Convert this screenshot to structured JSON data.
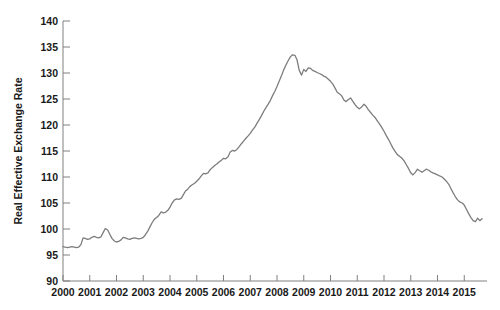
{
  "chart_data": {
    "type": "line",
    "title": "",
    "subtitle": "",
    "xlabel": "",
    "ylabel": "Real Effective Exchange Rate",
    "xlim": [
      2000.0,
      2015.85
    ],
    "ylim": [
      90,
      140
    ],
    "yticks": [
      90,
      95,
      100,
      105,
      110,
      115,
      120,
      125,
      130,
      135,
      140
    ],
    "ytick_labels": [
      "90",
      "95",
      "100",
      "105",
      "110",
      "115",
      "120",
      "125",
      "130",
      "135",
      "140"
    ],
    "xticks": [
      2000,
      2001,
      2002,
      2003,
      2004,
      2005,
      2006,
      2007,
      2008,
      2009,
      2010,
      2011,
      2012,
      2013,
      2014,
      2015
    ],
    "xtick_labels": [
      "2000",
      "2001",
      "2002",
      "2003",
      "2004",
      "2005",
      "2006",
      "2007",
      "2008",
      "2009",
      "2010",
      "2011",
      "2012",
      "2013",
      "2014",
      "2015"
    ],
    "grid": false,
    "legend": false,
    "legend_position": "none",
    "series": [
      {
        "name": "Real Effective Exchange Rate",
        "color": "#7d7d7d",
        "x": [
          2000.0,
          2000.08,
          2000.17,
          2000.25,
          2000.33,
          2000.42,
          2000.5,
          2000.58,
          2000.67,
          2000.75,
          2000.83,
          2000.92,
          2001.0,
          2001.08,
          2001.17,
          2001.25,
          2001.33,
          2001.42,
          2001.5,
          2001.58,
          2001.67,
          2001.75,
          2001.83,
          2001.92,
          2002.0,
          2002.08,
          2002.17,
          2002.25,
          2002.33,
          2002.42,
          2002.5,
          2002.58,
          2002.67,
          2002.75,
          2002.83,
          2002.92,
          2003.0,
          2003.08,
          2003.17,
          2003.25,
          2003.33,
          2003.42,
          2003.5,
          2003.58,
          2003.67,
          2003.75,
          2003.83,
          2003.92,
          2004.0,
          2004.08,
          2004.17,
          2004.25,
          2004.33,
          2004.42,
          2004.5,
          2004.58,
          2004.67,
          2004.75,
          2004.83,
          2004.92,
          2005.0,
          2005.08,
          2005.17,
          2005.25,
          2005.33,
          2005.42,
          2005.5,
          2005.58,
          2005.67,
          2005.75,
          2005.83,
          2005.92,
          2006.0,
          2006.08,
          2006.17,
          2006.25,
          2006.33,
          2006.42,
          2006.5,
          2006.58,
          2006.67,
          2006.75,
          2006.83,
          2006.92,
          2007.0,
          2007.08,
          2007.17,
          2007.25,
          2007.33,
          2007.42,
          2007.5,
          2007.58,
          2007.67,
          2007.75,
          2007.83,
          2007.92,
          2008.0,
          2008.08,
          2008.17,
          2008.25,
          2008.33,
          2008.42,
          2008.5,
          2008.58,
          2008.67,
          2008.75,
          2008.83,
          2008.92,
          2009.0,
          2009.08,
          2009.17,
          2009.25,
          2009.33,
          2009.42,
          2009.5,
          2009.58,
          2009.67,
          2009.75,
          2009.83,
          2009.92,
          2010.0,
          2010.08,
          2010.17,
          2010.25,
          2010.33,
          2010.42,
          2010.5,
          2010.58,
          2010.67,
          2010.75,
          2010.83,
          2010.92,
          2011.0,
          2011.08,
          2011.17,
          2011.25,
          2011.33,
          2011.42,
          2011.5,
          2011.58,
          2011.67,
          2011.75,
          2011.83,
          2011.92,
          2012.0,
          2012.08,
          2012.17,
          2012.25,
          2012.33,
          2012.42,
          2012.5,
          2012.58,
          2012.67,
          2012.75,
          2012.83,
          2012.92,
          2013.0,
          2013.08,
          2013.17,
          2013.25,
          2013.33,
          2013.42,
          2013.5,
          2013.58,
          2013.67,
          2013.75,
          2013.83,
          2013.92,
          2014.0,
          2014.08,
          2014.17,
          2014.25,
          2014.33,
          2014.42,
          2014.5,
          2014.58,
          2014.67,
          2014.75,
          2014.83,
          2014.92,
          2015.0,
          2015.08,
          2015.17,
          2015.25,
          2015.33,
          2015.42,
          2015.5,
          2015.58,
          2015.67
        ],
        "values": [
          96.6,
          96.5,
          96.4,
          96.5,
          96.6,
          96.5,
          96.4,
          96.5,
          97.0,
          98.3,
          98.2,
          98.0,
          98.1,
          98.4,
          98.6,
          98.4,
          98.3,
          98.5,
          99.3,
          100.1,
          99.8,
          99.0,
          98.2,
          97.7,
          97.5,
          97.6,
          97.9,
          98.4,
          98.3,
          98.1,
          98.0,
          98.2,
          98.3,
          98.2,
          98.1,
          98.2,
          98.4,
          98.9,
          99.6,
          100.4,
          101.2,
          101.9,
          102.2,
          102.6,
          103.3,
          103.1,
          103.2,
          103.6,
          104.2,
          105.0,
          105.6,
          105.8,
          105.7,
          105.9,
          106.6,
          107.3,
          107.7,
          108.2,
          108.5,
          108.8,
          109.2,
          109.6,
          110.2,
          110.7,
          110.6,
          110.8,
          111.4,
          111.8,
          112.2,
          112.5,
          112.9,
          113.2,
          113.6,
          113.5,
          113.9,
          114.8,
          115.1,
          115.0,
          115.3,
          115.8,
          116.4,
          116.9,
          117.4,
          117.9,
          118.4,
          119.0,
          119.6,
          120.3,
          121.0,
          121.8,
          122.6,
          123.3,
          124.0,
          124.7,
          125.6,
          126.5,
          127.4,
          128.4,
          129.5,
          130.6,
          131.5,
          132.4,
          133.1,
          133.5,
          133.4,
          132.5,
          130.5,
          129.6,
          130.7,
          130.3,
          131.0,
          130.9,
          130.5,
          130.3,
          130.1,
          129.9,
          129.7,
          129.4,
          129.2,
          128.8,
          128.4,
          127.9,
          127.1,
          126.3,
          126.0,
          125.6,
          124.8,
          124.5,
          124.9,
          125.2,
          124.6,
          123.9,
          123.4,
          123.1,
          123.5,
          124.0,
          123.6,
          122.9,
          122.4,
          121.9,
          121.4,
          120.8,
          120.2,
          119.5,
          118.8,
          118.0,
          117.2,
          116.4,
          115.6,
          114.9,
          114.3,
          114.0,
          113.6,
          113.1,
          112.4,
          111.6,
          110.8,
          110.4,
          110.9,
          111.5,
          111.2,
          110.9,
          111.2,
          111.5,
          111.3,
          111.0,
          110.8,
          110.6,
          110.4,
          110.2,
          110.0,
          109.6,
          109.2,
          108.6,
          107.8,
          107.0,
          106.2,
          105.6,
          105.2,
          105.0,
          104.6,
          103.8,
          102.9,
          102.2,
          101.6,
          101.4,
          102.1,
          101.6,
          102.0
        ]
      }
    ],
    "annotations": []
  },
  "layout": {
    "plot_left": 63,
    "plot_right": 487,
    "plot_top": 21,
    "plot_bottom": 281,
    "axis_color": "#808080",
    "text_color": "#1a1a1a",
    "background": "#ffffff"
  }
}
